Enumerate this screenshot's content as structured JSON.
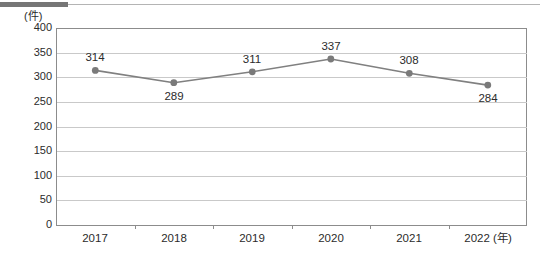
{
  "chart_data": {
    "type": "line",
    "title": "",
    "subtitle": "",
    "xlabel": "(年)",
    "ylabel": "(件)",
    "categories": [
      "2017",
      "2018",
      "2019",
      "2020",
      "2021",
      "2022"
    ],
    "values": [
      314,
      289,
      311,
      337,
      308,
      284
    ],
    "series": [
      {
        "name": "件数",
        "values": [
          314,
          289,
          311,
          337,
          308,
          284
        ]
      }
    ],
    "ylim": [
      0,
      400
    ],
    "ytick_step": 50,
    "yticks": [
      "400",
      "350",
      "300",
      "250",
      "200",
      "150",
      "100",
      "50",
      "0"
    ],
    "grid": true,
    "legend": "none",
    "marker": "circle",
    "line_color": "#808080",
    "marker_color": "#7a7a7a",
    "grid_color": "#c9c9c9",
    "axis_color": "#8c8c8c",
    "data_label_position": "alternating",
    "data_labels": [
      {
        "category": "2017",
        "value": "314",
        "position": "above"
      },
      {
        "category": "2018",
        "value": "289",
        "position": "below"
      },
      {
        "category": "2019",
        "value": "311",
        "position": "above"
      },
      {
        "category": "2020",
        "value": "337",
        "position": "above"
      },
      {
        "category": "2021",
        "value": "308",
        "position": "above"
      },
      {
        "category": "2022",
        "value": "284",
        "position": "below"
      }
    ]
  },
  "axes": {
    "y_unit_caption": "(件)",
    "x_unit_caption": "(年)",
    "y_labels": [
      "400",
      "350",
      "300",
      "250",
      "200",
      "150",
      "100",
      "50",
      "0"
    ],
    "x_labels": [
      "2017",
      "2018",
      "2019",
      "2020",
      "2021",
      "2022"
    ],
    "x_last_label_full": "2022 (年)"
  },
  "colors": {
    "rule_dark": "#767676",
    "rule_light": "#b4b4b4",
    "line": "#808080",
    "marker": "#7a7a7a",
    "grid": "#c9c9c9",
    "axis": "#8c8c8c",
    "text": "#2b2b2b"
  }
}
